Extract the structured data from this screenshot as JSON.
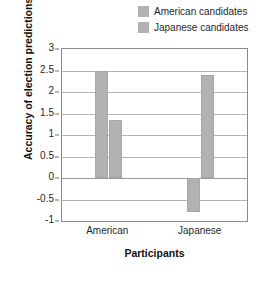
{
  "chart_data": {
    "type": "bar",
    "title": "",
    "xlabel": "Participants",
    "ylabel": "Accuracy of election predictions (t scores)",
    "ylabel_parts": {
      "before": "Accuracy of election predictions (",
      "italic": "t",
      "after": " scores)"
    },
    "categories": [
      "American",
      "Japanese"
    ],
    "series": [
      {
        "name": "American candidates",
        "values": [
          2.48,
          -0.78
        ],
        "color": "#b2b2b2"
      },
      {
        "name": "Japanese candidates",
        "values": [
          1.35,
          2.4
        ],
        "color": "#b2b2b2"
      }
    ],
    "ylim": [
      -1,
      3
    ],
    "yticks": [
      3,
      2.5,
      2,
      1.5,
      1,
      0.5,
      0,
      -0.5,
      -1
    ],
    "ytick_labels": [
      "3",
      "2.5",
      "2",
      "1.5",
      "1",
      "0.5",
      "0",
      "-0.5",
      "-1"
    ],
    "grid": true,
    "legend_position": "top-right"
  },
  "legend": {
    "items": [
      {
        "label": "American candidates",
        "color": "#b2b2b2"
      },
      {
        "label": "Japanese candidates",
        "color": "#b2b2b2"
      }
    ]
  }
}
